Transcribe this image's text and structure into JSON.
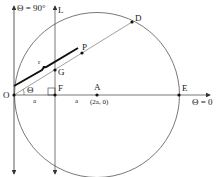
{
  "diagram": {
    "colors": {
      "stroke": "#333333",
      "thick": "#111111",
      "light": "#888888"
    },
    "labels": {
      "theta90": "Θ = 90°",
      "L": "L",
      "D": "D",
      "P": "P",
      "r": "r",
      "G": "G",
      "O": "O",
      "theta": "Θ",
      "F": "F",
      "A": "A",
      "A_coord": "(2a, 0)",
      "a1": "a",
      "a2": "a",
      "E": "E",
      "theta0": "Θ = 0"
    },
    "points": {
      "O": [
        14,
        95
      ],
      "F": [
        55,
        95
      ],
      "A": [
        97,
        95
      ],
      "E": [
        179,
        95
      ],
      "G": [
        55,
        70
      ],
      "P": [
        82,
        53
      ],
      "D": [
        132,
        22
      ]
    }
  }
}
